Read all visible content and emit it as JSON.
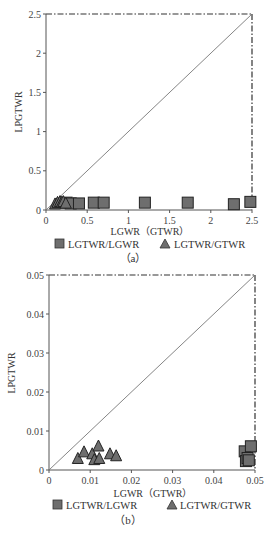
{
  "chart_data": [
    {
      "panel": "(a)",
      "type": "scatter",
      "xlabel": "LGWR（GTWR）",
      "ylabel": "LPGTWR",
      "xlim": [
        0,
        2.5
      ],
      "ylim": [
        0,
        2.5
      ],
      "x_ticks": [
        "0",
        "0.5",
        "1",
        "1.5",
        "2",
        "2.5"
      ],
      "y_ticks": [
        "0",
        "0.5",
        "1",
        "1.5",
        "2",
        "2.5"
      ],
      "reference_line": "y = x",
      "boundary": "dash-dot lines at x = 2.5 and y = 2.5",
      "grid": false,
      "legend_position": "bottom",
      "series": [
        {
          "name": "LGTWR/LGWR",
          "marker": "square",
          "color": "#6e6e6e",
          "points": [
            [
              0.25,
              0.03
            ],
            [
              0.3,
              0.02
            ],
            [
              0.4,
              0.02
            ],
            [
              0.58,
              0.03
            ],
            [
              0.7,
              0.03
            ],
            [
              1.2,
              0.03
            ],
            [
              1.72,
              0.03
            ],
            [
              2.28,
              0.01
            ],
            [
              2.48,
              0.04
            ]
          ]
        },
        {
          "name": "LGTWR/GTWR",
          "marker": "triangle",
          "color": "#6e6e6e",
          "points": [
            [
              0.11,
              0.02
            ],
            [
              0.14,
              0.04
            ],
            [
              0.17,
              0.05
            ],
            [
              0.19,
              0.04
            ],
            [
              0.21,
              0.05
            ],
            [
              0.24,
              0.03
            ]
          ]
        }
      ]
    },
    {
      "panel": "(b)",
      "type": "scatter",
      "xlabel": "LGWR（GTWR）",
      "ylabel": "LPGTWR",
      "xlim": [
        0,
        0.05
      ],
      "ylim": [
        0,
        0.05
      ],
      "x_ticks": [
        "0",
        "0.01",
        "0.02",
        "0.03",
        "0.04",
        "0.05"
      ],
      "y_ticks": [
        "0",
        "0.01",
        "0.02",
        "0.03",
        "0.04",
        "0.05"
      ],
      "reference_line": "y = x",
      "boundary": "dash-dot lines at x = 0.05 and y = 0.05",
      "grid": false,
      "legend_position": "bottom",
      "series": [
        {
          "name": "LGTWR/LGWR",
          "marker": "square",
          "color": "#6e6e6e",
          "points": [
            [
              0.0475,
              0.0035
            ],
            [
              0.0478,
              0.001
            ],
            [
              0.0482,
              0.0018
            ],
            [
              0.049,
              0.0048
            ],
            [
              0.0485,
              0.0012
            ]
          ]
        },
        {
          "name": "LGTWR/GTWR",
          "marker": "triangle",
          "color": "#6e6e6e",
          "points": [
            [
              0.007,
              0.0018
            ],
            [
              0.0085,
              0.0035
            ],
            [
              0.0105,
              0.003
            ],
            [
              0.012,
              0.005
            ],
            [
              0.011,
              0.0015
            ],
            [
              0.0122,
              0.0018
            ],
            [
              0.0148,
              0.003
            ],
            [
              0.0163,
              0.0025
            ]
          ]
        }
      ]
    }
  ],
  "legend": {
    "square_label": "LGTWR/LGWR",
    "triangle_label": "LGTWR/GTWR"
  },
  "panels": {
    "a": {
      "label": "（a）",
      "ylabel": "LPGTWR",
      "xlabel": "LGWR（GTWR）"
    },
    "b": {
      "label": "（b）",
      "ylabel": "LPGTWR",
      "xlabel": "LGWR（GTWR）"
    }
  }
}
